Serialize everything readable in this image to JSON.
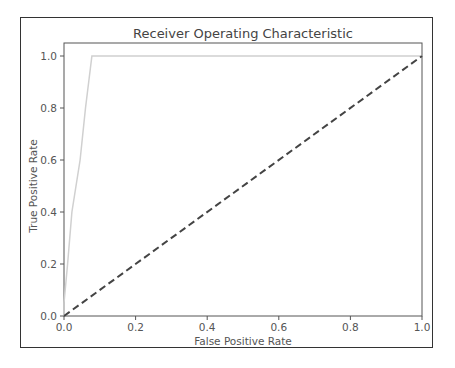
{
  "chart_data": {
    "type": "line",
    "title": "Receiver Operating Characteristic",
    "xlabel": "False Positive Rate",
    "ylabel": "True Positive Rate",
    "xlim": [
      0.0,
      1.0
    ],
    "ylim": [
      0.0,
      1.05
    ],
    "xticks": [
      "0.0",
      "0.2",
      "0.4",
      "0.6",
      "0.8",
      "1.0"
    ],
    "yticks": [
      "0.0",
      "0.2",
      "0.4",
      "0.6",
      "0.8",
      "1.0"
    ],
    "grid": false,
    "legend": null,
    "series": [
      {
        "name": "ROC curve",
        "color": "#d0d0d0",
        "style": "solid",
        "x": [
          0.0,
          0.0,
          0.01,
          0.022,
          0.045,
          0.06,
          0.078,
          1.0
        ],
        "y": [
          0.0,
          0.05,
          0.2,
          0.4,
          0.6,
          0.8,
          1.0,
          1.0
        ]
      },
      {
        "name": "Random classifier",
        "color": "#444444",
        "style": "dashed",
        "x": [
          0.0,
          1.0
        ],
        "y": [
          0.0,
          1.0
        ]
      }
    ]
  }
}
